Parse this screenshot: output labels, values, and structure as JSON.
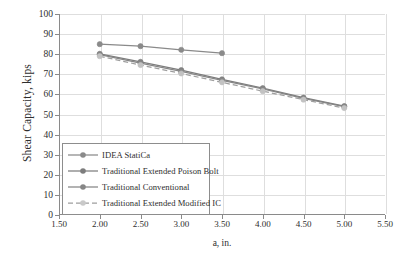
{
  "chart_data": {
    "type": "line",
    "title": "",
    "xlabel": "a, in.",
    "ylabel": "Shear Capacity, kips",
    "xlim": [
      1.5,
      5.5
    ],
    "ylim": [
      0,
      100
    ],
    "xticks": [
      "1.50",
      "2.00",
      "2.50",
      "3.00",
      "3.50",
      "4.00",
      "4.50",
      "5.00",
      "5.50"
    ],
    "xtick_values": [
      1.5,
      2.0,
      2.5,
      3.0,
      3.5,
      4.0,
      4.5,
      5.0,
      5.5
    ],
    "yticks": [
      "0",
      "10",
      "20",
      "30",
      "40",
      "50",
      "60",
      "70",
      "80",
      "90",
      "100"
    ],
    "ytick_values": [
      0,
      10,
      20,
      30,
      40,
      50,
      60,
      70,
      80,
      90,
      100
    ],
    "grid": true,
    "legend_position": "lower-left-inside",
    "marker": "circle",
    "series": [
      {
        "name": "IDEA StatiCa",
        "color": "#8a8a8a",
        "style": "solid",
        "x": [
          2.0,
          2.5,
          3.0,
          3.5
        ],
        "values": [
          85.0,
          84.0,
          82.2,
          80.5
        ]
      },
      {
        "name": "Traditional Extended Poison Bolt",
        "color": "#7d7d7d",
        "style": "solid",
        "x": [
          2.0,
          2.5,
          3.0,
          3.5,
          4.0,
          4.5,
          5.0
        ],
        "values": [
          80.2,
          76.2,
          72.1,
          67.5,
          63.1,
          58.4,
          54.2
        ]
      },
      {
        "name": "Traditional Conventional",
        "color": "#868686",
        "style": "solid",
        "x": [
          2.0,
          2.5,
          3.0,
          3.5,
          4.0,
          4.5,
          5.0
        ],
        "values": [
          79.8,
          75.6,
          71.5,
          67.0,
          62.7,
          58.0,
          53.9
        ]
      },
      {
        "name": "Traditional Extended Modified IC",
        "color": "#9e9e9e",
        "style": "dashed",
        "x": [
          2.0,
          2.5,
          3.0,
          3.5,
          4.0,
          4.5,
          5.0
        ],
        "values": [
          79.0,
          74.6,
          70.4,
          66.0,
          61.6,
          57.4,
          53.2
        ]
      }
    ]
  },
  "legend": {
    "items": [
      {
        "label": "IDEA StatiCa"
      },
      {
        "label": "Traditional Extended Poison Bolt"
      },
      {
        "label": "Traditional Conventional"
      },
      {
        "label": "Traditional Extended Modified IC"
      }
    ]
  },
  "colors": {
    "axis": "#8a8a8a",
    "grid": "#dedede",
    "text": "#2e2e2e",
    "background": "#ffffff"
  }
}
